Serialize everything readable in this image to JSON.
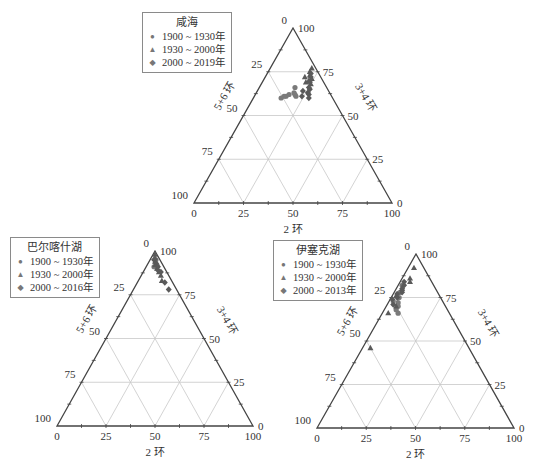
{
  "figure": {
    "colors": {
      "axis": "#444444",
      "grid": "#c8c8c8",
      "marker": "#7a7a7a",
      "marker_dark": "#5a5a5a"
    },
    "axis_titles": {
      "bottom": "2 环",
      "left": "5+6 环",
      "right": "3+4 环"
    },
    "tick_labels": [
      "0",
      "25",
      "50",
      "75",
      "100"
    ]
  },
  "chart_data": [
    {
      "type": "scatter",
      "subtype": "ternary",
      "title": "咸海",
      "axes": {
        "bottom": "2 环",
        "left": "5+6 环",
        "right": "3+4 环"
      },
      "ticks": [
        0,
        25,
        50,
        75,
        100
      ],
      "grid": true,
      "legend_position": "upper-left",
      "legend": [
        "1900 ~ 1930年",
        "1930 ~ 2000年",
        "2000 ~ 2019年"
      ],
      "series": [
        {
          "name": "1900 ~ 1930年",
          "marker": "circle",
          "points": [
            [
              18,
              66,
              16
            ],
            [
              19,
              63,
              18
            ],
            [
              20,
              62,
              18
            ],
            [
              17,
              62,
              21
            ],
            [
              16,
              61,
              23
            ],
            [
              15,
              61,
              24
            ],
            [
              14,
              60,
              26
            ],
            [
              21,
              61,
              18
            ]
          ]
        },
        {
          "name": "1930 ~ 2000年",
          "marker": "triangle",
          "points": [
            [
              21,
              77,
              2
            ],
            [
              21,
              75,
              4
            ],
            [
              22,
              73,
              5
            ],
            [
              24,
              71,
              5
            ],
            [
              20,
              72,
              8
            ],
            [
              23,
              70,
              7
            ],
            [
              25,
              68,
              7
            ],
            [
              22,
              69,
              9
            ]
          ]
        },
        {
          "name": "2000 ~ 2019年",
          "marker": "diamond",
          "points": [
            [
              22,
              74,
              4
            ],
            [
              23,
              72,
              5
            ],
            [
              24,
              69,
              7
            ],
            [
              25,
              66,
              9
            ],
            [
              26,
              63,
              11
            ],
            [
              27,
              62,
              11
            ],
            [
              23,
              64,
              13
            ],
            [
              24,
              61,
              15
            ],
            [
              28,
              60,
              12
            ],
            [
              26,
              65,
              9
            ]
          ]
        }
      ]
    },
    {
      "type": "scatter",
      "subtype": "ternary",
      "title": "巴尔喀什湖",
      "axes": {
        "bottom": "2 环",
        "left": "5+6 环",
        "right": "3+4 环"
      },
      "ticks": [
        0,
        25,
        50,
        75,
        100
      ],
      "grid": true,
      "legend_position": "upper-left",
      "legend": [
        "1900 ~ 1930年",
        "1930 ~ 2000年",
        "2000 ~ 2016年"
      ],
      "series": [
        {
          "name": "1900 ~ 1930年",
          "marker": "circle",
          "points": [
            [
              3,
              95,
              2
            ],
            [
              5,
              92,
              3
            ],
            [
              4,
              91,
              5
            ]
          ]
        },
        {
          "name": "1930 ~ 2000年",
          "marker": "triangle",
          "points": [
            [
              1,
              98,
              1
            ],
            [
              2,
              96,
              2
            ],
            [
              3,
              94,
              3
            ],
            [
              4,
              92,
              4
            ],
            [
              6,
              90,
              4
            ],
            [
              8,
              88,
              4
            ],
            [
              10,
              86,
              4
            ],
            [
              12,
              83,
              5
            ]
          ]
        },
        {
          "name": "2000 ~ 2016年",
          "marker": "diamond",
          "points": [
            [
              2,
              95,
              3
            ],
            [
              4,
              93,
              3
            ],
            [
              6,
              91,
              3
            ],
            [
              9,
              88,
              3
            ],
            [
              7,
              89,
              4
            ],
            [
              14,
              82,
              4
            ],
            [
              18,
              78,
              4
            ]
          ]
        }
      ]
    },
    {
      "type": "scatter",
      "subtype": "ternary",
      "title": "伊塞克湖",
      "axes": {
        "bottom": "2 环",
        "left": "5+6 环",
        "right": "3+4 环"
      },
      "ticks": [
        0,
        25,
        50,
        75,
        100
      ],
      "grid": true,
      "legend_position": "upper-left",
      "legend": [
        "1900 ~ 1930年",
        "1930 ~ 2000年",
        "2000 ~ 2013年"
      ],
      "series": [
        {
          "name": "1900 ~ 1930年",
          "marker": "circle",
          "points": [
            [
              2,
              82,
              16
            ],
            [
              3,
              78,
              19
            ],
            [
              4,
              75,
              21
            ],
            [
              5,
              72,
              23
            ],
            [
              6,
              70,
              24
            ],
            [
              2,
              73,
              25
            ],
            [
              6,
              68,
              26
            ],
            [
              8,
              66,
              26
            ]
          ]
        },
        {
          "name": "1930 ~ 2000年",
          "marker": "triangle",
          "points": [
            [
              3,
              92,
              5
            ],
            [
              4,
              86,
              10
            ],
            [
              5,
              84,
              11
            ],
            [
              3,
              80,
              17
            ],
            [
              2,
              76,
              22
            ],
            [
              5,
              70,
              25
            ],
            [
              3,
              66,
              31
            ],
            [
              4,
              46,
              50
            ]
          ]
        },
        {
          "name": "2000 ~ 2013年",
          "marker": "diamond",
          "points": [
            [
              2,
              84,
              14
            ],
            [
              3,
              82,
              15
            ],
            [
              3,
              80,
              17
            ],
            [
              4,
              78,
              18
            ],
            [
              2,
              77,
              21
            ],
            [
              3,
              75,
              22
            ],
            [
              1,
              74,
              25
            ],
            [
              3,
              71,
              26
            ]
          ]
        }
      ]
    }
  ]
}
